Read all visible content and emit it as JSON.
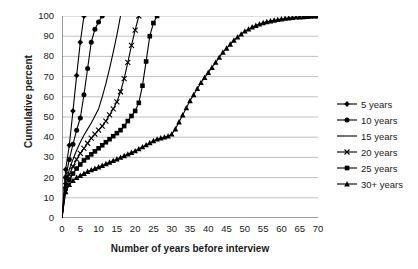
{
  "chart_data": {
    "type": "line",
    "title": "",
    "xlabel": "Number of years before interview",
    "ylabel": "Cumulative percent",
    "xlim": [
      0,
      70
    ],
    "ylim": [
      0,
      100
    ],
    "xticks": [
      0,
      5,
      10,
      15,
      20,
      25,
      30,
      35,
      40,
      45,
      50,
      55,
      60,
      65,
      70
    ],
    "yticks": [
      0,
      10,
      20,
      30,
      40,
      50,
      60,
      70,
      80,
      90,
      100
    ],
    "grid": "horizontal",
    "legend_position": "right",
    "series": [
      {
        "name": "5 years",
        "marker": "diamond",
        "color": "#000000",
        "x": [
          0,
          1,
          2,
          3,
          4,
          5,
          6
        ],
        "y": [
          0,
          24.0,
          36.0,
          53.0,
          70.5,
          87.0,
          100.0
        ]
      },
      {
        "name": "10 years",
        "marker": "circle",
        "color": "#000000",
        "x": [
          0,
          1,
          2,
          3,
          4,
          5,
          6,
          7,
          8,
          9,
          10,
          11
        ],
        "y": [
          0,
          20.0,
          29.0,
          36.5,
          43.5,
          49.5,
          61.0,
          74.0,
          87.0,
          93.5,
          97.0,
          100.0
        ]
      },
      {
        "name": "15 years",
        "marker": "none",
        "color": "#000000",
        "x": [
          0,
          1,
          2,
          3,
          4,
          5,
          6,
          7,
          8,
          9,
          10,
          11,
          12,
          13,
          14,
          15,
          16
        ],
        "y": [
          0,
          17.5,
          24.0,
          29.0,
          33.5,
          37.5,
          41.0,
          44.0,
          47.0,
          50.5,
          54.0,
          60.0,
          66.5,
          74.0,
          82.0,
          90.5,
          100.0
        ]
      },
      {
        "name": "20 years",
        "marker": "cross",
        "color": "#000000",
        "x": [
          0,
          1,
          2,
          3,
          4,
          5,
          6,
          7,
          8,
          9,
          10,
          11,
          12,
          13,
          14,
          15,
          16,
          17,
          18,
          19,
          20,
          21
        ],
        "y": [
          0,
          16.0,
          21.5,
          25.5,
          29.0,
          32.0,
          34.5,
          37.0,
          39.5,
          41.5,
          43.5,
          45.5,
          48.0,
          51.0,
          54.0,
          57.5,
          62.5,
          69.0,
          77.0,
          85.5,
          93.0,
          100.0
        ]
      },
      {
        "name": "25 years",
        "marker": "square",
        "color": "#000000",
        "x": [
          0,
          1,
          2,
          3,
          4,
          5,
          6,
          7,
          8,
          9,
          10,
          11,
          12,
          13,
          14,
          15,
          16,
          17,
          18,
          19,
          20,
          21,
          22,
          23,
          24,
          25,
          26
        ],
        "y": [
          0,
          14.5,
          19.0,
          22.0,
          24.5,
          26.5,
          28.5,
          30.0,
          31.5,
          33.0,
          34.5,
          36.0,
          37.5,
          39.0,
          40.5,
          42.0,
          43.5,
          45.5,
          48.0,
          50.5,
          53.0,
          57.0,
          65.5,
          77.5,
          90.0,
          96.5,
          100.0
        ]
      },
      {
        "name": "30+ years",
        "marker": "triangle",
        "color": "#000000",
        "x": [
          0,
          1,
          2,
          3,
          4,
          5,
          6,
          7,
          8,
          9,
          10,
          11,
          12,
          13,
          14,
          15,
          16,
          17,
          18,
          19,
          20,
          21,
          22,
          23,
          24,
          25,
          26,
          27,
          28,
          29,
          30,
          31,
          32,
          33,
          34,
          35,
          36,
          37,
          38,
          39,
          40,
          41,
          42,
          43,
          44,
          45,
          46,
          47,
          48,
          49,
          50,
          51,
          52,
          53,
          54,
          55,
          56,
          57,
          58,
          59,
          60,
          61,
          62,
          63,
          64,
          65,
          66,
          67,
          68,
          69,
          70
        ],
        "y": [
          0,
          13.0,
          16.5,
          18.5,
          20.0,
          21.0,
          22.0,
          23.0,
          23.8,
          24.5,
          25.2,
          26.0,
          26.8,
          27.6,
          28.4,
          29.2,
          30.0,
          30.8,
          31.6,
          32.4,
          33.2,
          34.2,
          35.2,
          36.2,
          37.2,
          38.2,
          39.0,
          39.6,
          40.0,
          40.5,
          41.5,
          44.0,
          47.5,
          51.0,
          54.5,
          58.0,
          61.0,
          64.0,
          67.0,
          69.5,
          72.0,
          74.5,
          77.0,
          79.5,
          82.0,
          84.0,
          86.0,
          88.0,
          89.5,
          91.0,
          92.5,
          93.5,
          94.5,
          95.3,
          96.0,
          96.6,
          97.1,
          97.5,
          97.9,
          98.2,
          98.5,
          98.8,
          99.0,
          99.2,
          99.4,
          99.5,
          99.6,
          99.7,
          99.8,
          99.9,
          100.0
        ]
      }
    ]
  },
  "legend": {
    "items": [
      {
        "label": "5 years",
        "marker": "diamond"
      },
      {
        "label": "10 years",
        "marker": "circle"
      },
      {
        "label": "15 years",
        "marker": "none"
      },
      {
        "label": "20 years",
        "marker": "cross"
      },
      {
        "label": "25 years",
        "marker": "square"
      },
      {
        "label": "30+ years",
        "marker": "triangle"
      }
    ]
  },
  "colors": {
    "series": "#000000",
    "grid": "#b0b0b0",
    "axis": "#595959",
    "text": "#1a1a1a",
    "background": "#ffffff"
  }
}
